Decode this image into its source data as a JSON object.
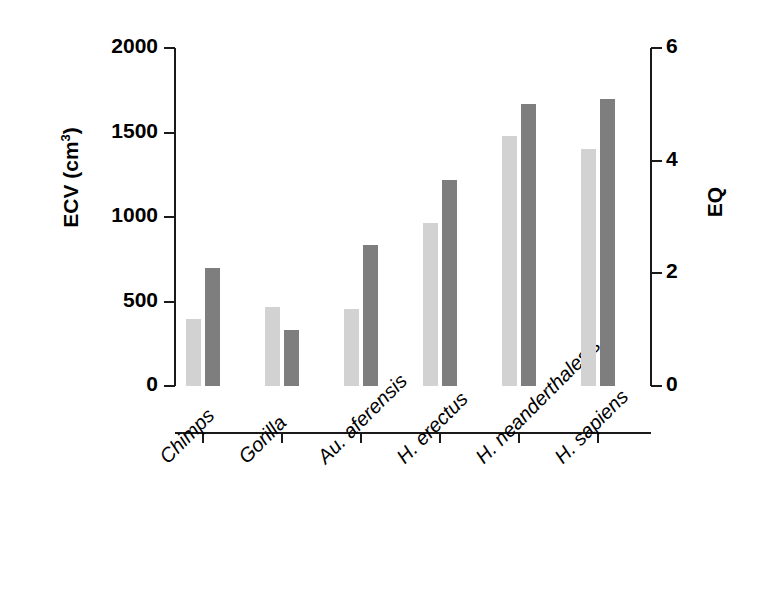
{
  "chart_data": {
    "type": "bar",
    "title": "",
    "subtitle": "",
    "categories": [
      "Chimps",
      "Gorilla",
      "Au. aferensis",
      "H. erectus",
      "H. neanderthalesis",
      "H. sapiens"
    ],
    "series": [
      {
        "name": "ECV",
        "axis": "left",
        "color": "#d2d2d2",
        "values": [
          395,
          465,
          455,
          965,
          1480,
          1400
        ]
      },
      {
        "name": "EQ",
        "axis": "right",
        "color": "#7e7e7e",
        "values": [
          2.1,
          1.0,
          2.5,
          3.65,
          5.0,
          5.1
        ]
      }
    ],
    "xlabel": "",
    "ylabel_left": "ECV (cm3)",
    "ylabel_right": "EQ",
    "ylim_left": [
      0,
      2000
    ],
    "ylim_right": [
      0,
      6
    ],
    "yticks_left": [
      0,
      500,
      1000,
      1500,
      2000
    ],
    "yticks_right": [
      0,
      2,
      4,
      6
    ],
    "grid": false,
    "legend": "none"
  },
  "axes": {
    "left": {
      "title_main": "ECV (cm",
      "title_sup": "3",
      "title_close": ")",
      "ticks": [
        {
          "label": "2000",
          "value": 2000
        },
        {
          "label": "1500",
          "value": 1500
        },
        {
          "label": "1000",
          "value": 1000
        },
        {
          "label": "500",
          "value": 500
        },
        {
          "label": "0",
          "value": 0
        }
      ]
    },
    "right": {
      "title": "EQ",
      "ticks": [
        {
          "label": "6",
          "value": 6
        },
        {
          "label": "4",
          "value": 4
        },
        {
          "label": "2",
          "value": 2
        },
        {
          "label": "0",
          "value": 0
        }
      ]
    },
    "x": {
      "categories": [
        {
          "label": "Chimps"
        },
        {
          "label": "Gorilla"
        },
        {
          "label": "Au. aferensis"
        },
        {
          "label": "H. erectus"
        },
        {
          "label": "H. neanderthalesis"
        },
        {
          "label": "H. sapiens"
        }
      ]
    }
  },
  "colors": {
    "ecv_bar": "#d2d2d2",
    "eq_bar": "#7e7e7e",
    "axis": "#1a1a1a",
    "text": "#000000",
    "background": "#ffffff"
  }
}
